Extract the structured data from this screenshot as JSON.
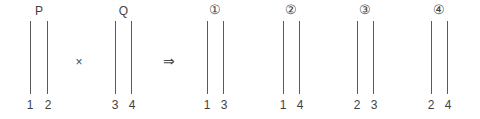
{
  "figure": {
    "type": "combinatorial-diagram",
    "background_color": "#ffffff",
    "rod_color": "#5a5a5a",
    "text_color": "#3f3f3f"
  },
  "operators": {
    "multiply": "×",
    "implies": "⇒"
  },
  "groups": [
    {
      "id": "group-p",
      "label": "P",
      "label_kind": "letter",
      "left_number": "1",
      "right_number": "2",
      "left_px": 30,
      "width_px": 18
    },
    {
      "id": "group-q",
      "label": "Q",
      "label_kind": "letter",
      "left_number": "3",
      "right_number": "4",
      "left_px": 115,
      "width_px": 17
    },
    {
      "id": "group-result-1",
      "label": "①",
      "label_kind": "circled-number",
      "left_number": "1",
      "right_number": "3",
      "left_px": 207,
      "width_px": 17
    },
    {
      "id": "group-result-2",
      "label": "②",
      "label_kind": "circled-number",
      "left_number": "1",
      "right_number": "4",
      "left_px": 283,
      "width_px": 17
    },
    {
      "id": "group-result-3",
      "label": "③",
      "label_kind": "circled-number",
      "left_number": "2",
      "right_number": "3",
      "left_px": 357,
      "width_px": 17
    },
    {
      "id": "group-result-4",
      "label": "④",
      "label_kind": "circled-number",
      "left_number": "2",
      "right_number": "4",
      "left_px": 431,
      "width_px": 17
    }
  ]
}
